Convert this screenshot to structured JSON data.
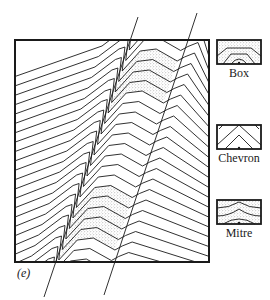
{
  "figure": {
    "panel_label": "(e)",
    "frame": {
      "x": 15,
      "y": 40,
      "width": 194,
      "height": 222
    },
    "colors": {
      "ink": "#1a1a1a",
      "stipple": "#8a8a8a",
      "background": "#ffffff"
    },
    "faults": [
      {
        "name": "fault-left",
        "x1": 138,
        "y1": 17,
        "x2": 44,
        "y2": 297
      },
      {
        "name": "fault-right",
        "x1": 197,
        "y1": 13,
        "x2": 104,
        "y2": 295
      }
    ],
    "layer_count": 24,
    "stippled_zones": [
      {
        "name": "upper-stippled-fold",
        "layers_from": 2,
        "layers_to": 6
      },
      {
        "name": "lower-stippled-fold",
        "layers_from": 15,
        "layers_to": 20
      }
    ]
  },
  "legend": {
    "items": [
      {
        "label": "Box",
        "style": "box",
        "x": 217,
        "y": 40,
        "w": 44,
        "h": 24
      },
      {
        "label": "Chevron",
        "style": "chevron",
        "x": 217,
        "y": 125,
        "w": 44,
        "h": 24
      },
      {
        "label": "Mitre",
        "style": "mitre",
        "x": 217,
        "y": 200,
        "w": 44,
        "h": 24
      }
    ]
  }
}
